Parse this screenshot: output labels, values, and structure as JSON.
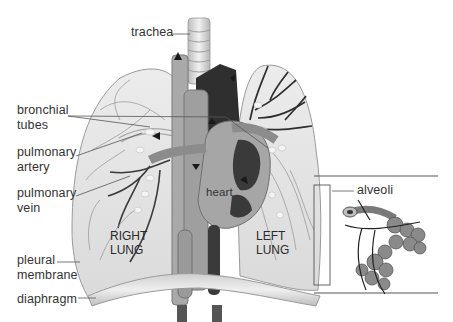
{
  "diagram": {
    "labels": {
      "trachea": "trachea",
      "bronchial_tubes": "bronchial\ntubes",
      "pulmonary_artery": "pulmonary\nartery",
      "pulmonary_vein": "pulmonary\nvein",
      "pleural_membrane": "pleural\nmembrane",
      "diaphragm": "diaphragm",
      "heart": "heart",
      "right_lung": "RIGHT\nLUNG",
      "left_lung": "LEFT\nLUNG",
      "alveoli": "alveoli"
    },
    "colors": {
      "background": "#ffffff",
      "label_text": "#333333",
      "leader_line": "#555555",
      "lung_tissue": "#e4e4e4",
      "vessel_dark": "#2e2e2e",
      "vessel_mid": "#8a8a8a",
      "heart_mid": "#a6a6a6",
      "diaphragm": "#d8d8d8"
    }
  }
}
